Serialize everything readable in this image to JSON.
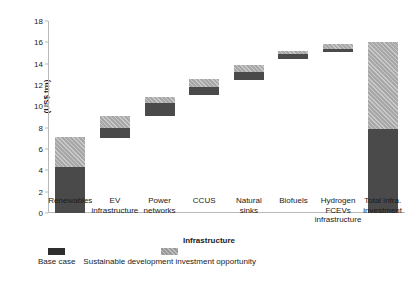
{
  "chart_data": {
    "type": "bar",
    "title": "",
    "subtitle": "",
    "xlabel": "Infrastructure",
    "ylabel": "(US$ trn)",
    "ylim": [
      0,
      18
    ],
    "yticks": [
      0,
      2,
      4,
      6,
      8,
      10,
      12,
      14,
      16,
      18
    ],
    "grid": false,
    "stacked": true,
    "floating_bars": true,
    "legend_position": "bottom-left",
    "units": "US$ trn",
    "categories": [
      "Renewables",
      "EV infrastructure",
      "Power networks",
      "CCUS",
      "Natural sinks",
      "Biofuels",
      "Hydrogen FCEVs infrastructure",
      "Total infra. investment"
    ],
    "category_lines": [
      [
        "Renewables"
      ],
      [
        "EV",
        "infrastructure"
      ],
      [
        "Power",
        "networks"
      ],
      [
        "CCUS"
      ],
      [
        "Natural",
        "sinks"
      ],
      [
        "Biofuels"
      ],
      [
        "Hydrogen",
        "FCEVs",
        "infrastructure"
      ],
      [
        "Total infra.",
        "investment"
      ]
    ],
    "series": [
      {
        "name": "Base case",
        "color": "#4a4a4a",
        "bottoms": [
          0.0,
          7.0,
          9.1,
          11.1,
          12.5,
          14.4,
          15.1,
          0.0
        ],
        "tops": [
          4.3,
          8.0,
          10.3,
          11.8,
          13.2,
          14.9,
          15.4,
          7.9
        ],
        "values": [
          4.3,
          1.0,
          1.2,
          0.7,
          0.7,
          0.5,
          0.3,
          7.9
        ]
      },
      {
        "name": "Sustainable development investment opportunity",
        "color": "#a8a8a8",
        "bottoms": [
          4.3,
          8.0,
          10.3,
          11.8,
          13.2,
          14.9,
          15.4,
          7.9
        ],
        "tops": [
          7.1,
          9.1,
          10.9,
          12.6,
          13.9,
          15.2,
          15.8,
          16.0
        ],
        "values": [
          2.8,
          1.1,
          0.6,
          0.8,
          0.7,
          0.3,
          0.4,
          8.1
        ]
      }
    ],
    "totals": [
      7.1,
      9.1,
      10.9,
      12.6,
      13.9,
      15.2,
      15.8,
      16.0
    ]
  },
  "legend": {
    "items": [
      {
        "label": "Base case",
        "swatch": "base"
      },
      {
        "label": "Sustainable development investment opportunity",
        "swatch": "opp"
      }
    ]
  }
}
